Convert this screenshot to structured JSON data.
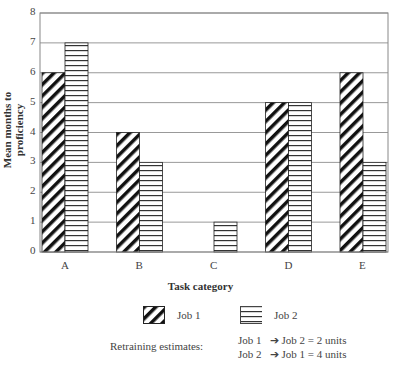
{
  "chart_data": {
    "type": "bar",
    "title": "",
    "xlabel": "Task category",
    "ylabel": "Mean months to proficiency",
    "categories": [
      "A",
      "B",
      "C",
      "D",
      "E"
    ],
    "series": [
      {
        "name": "Job 1",
        "pattern": "diagonal-hatch",
        "values": [
          6,
          4,
          0,
          5,
          6
        ]
      },
      {
        "name": "Job 2",
        "pattern": "horizontal-lines",
        "values": [
          7,
          3,
          1,
          5,
          3
        ]
      }
    ],
    "ylim": [
      0,
      8
    ],
    "yticks": [
      0,
      1,
      2,
      3,
      4,
      5,
      6,
      7,
      8
    ],
    "grid": "horizontal",
    "legend_position": "bottom"
  },
  "legend": {
    "job1": "Job 1",
    "job2": "Job 2"
  },
  "retraining": {
    "label": "Retraining estimates:",
    "lines": [
      {
        "from": "Job 1",
        "to": "Job 2 = 2 units"
      },
      {
        "from": "Job 2",
        "to": "Job 1 = 4 units"
      }
    ]
  },
  "colors": {
    "axis": "#888888",
    "grid": "#999999",
    "bar_stroke": "#222222"
  }
}
